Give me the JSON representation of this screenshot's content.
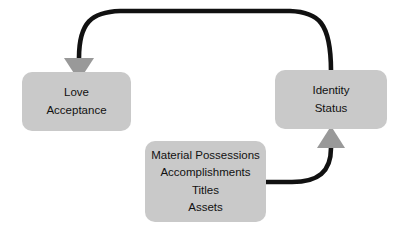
{
  "diagram": {
    "colors": {
      "node_fill": "#c9c9c9",
      "arrow_line": "#111111",
      "arrow_head": "#999999",
      "background": "#ffffff",
      "text": "#111111"
    },
    "nodes": [
      {
        "id": "love",
        "name": "love-acceptance-node",
        "lines": [
          "Love",
          "Acceptance"
        ]
      },
      {
        "id": "identity",
        "name": "identity-status-node",
        "lines": [
          "Identity",
          "Status"
        ]
      },
      {
        "id": "assets",
        "name": "material-possessions-node",
        "lines": [
          "Material Possessions",
          "Accomplishments",
          "Titles",
          "Assets"
        ]
      }
    ],
    "connectors": [
      {
        "id": "identity-to-love",
        "name": "identity-to-love-arrow",
        "from": "identity",
        "to": "love",
        "head_direction": "down"
      },
      {
        "id": "assets-to-identity",
        "name": "assets-to-identity-arrow",
        "from": "assets",
        "to": "identity",
        "head_direction": "up"
      }
    ]
  }
}
